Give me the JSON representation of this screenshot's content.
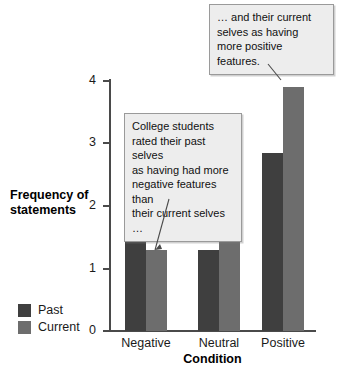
{
  "chart_data": {
    "type": "bar",
    "title": "",
    "xlabel": "Condition",
    "ylabel": "Frequency of statements",
    "ylabel_lines": [
      "Frequency of",
      "statements"
    ],
    "categories": [
      "Negative",
      "Neutral",
      "Positive"
    ],
    "series": [
      {
        "name": "Past",
        "color": "#3f3f3f",
        "values": [
          2.2,
          1.3,
          2.85
        ]
      },
      {
        "name": "Current",
        "color": "#6d6d6d",
        "values": [
          1.3,
          1.55,
          3.9
        ]
      }
    ],
    "ylim": [
      0,
      4
    ],
    "yticks": [
      0,
      1,
      2,
      3,
      4
    ],
    "ytick_labels": [
      "0",
      "1",
      "2",
      "3",
      "4"
    ],
    "grid": false,
    "legend_position": "lower-left-outside",
    "annotations": [
      {
        "id": "callout-top",
        "text": "… and their current selves as having more positive features.",
        "lines": [
          "… and their current",
          "selves as having",
          "more positive features."
        ],
        "points_to": "Positive / Current bar"
      },
      {
        "id": "callout-mid",
        "text": "College students rated their past selves as having had more negative features than their current selves …",
        "lines": [
          "College students",
          "rated their past selves",
          "as having had more",
          "negative features than",
          "their current selves …"
        ],
        "points_to": "Negative / Current bar"
      }
    ]
  },
  "colors": {
    "past": "#3f3f3f",
    "current": "#6d6d6d",
    "axis": "#4a4a4a",
    "callout_bg": "#ededed",
    "callout_border": "#9a9a9a",
    "background": "#ffffff"
  }
}
